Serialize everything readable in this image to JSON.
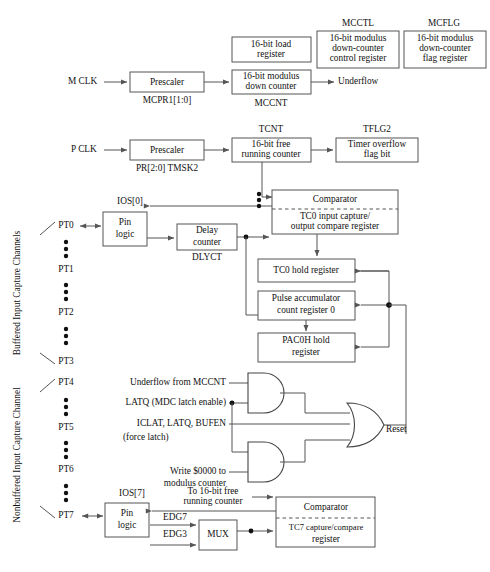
{
  "diagram": {
    "colors": {
      "line": "#555555",
      "box_fill": "#ffffff",
      "text": "#111111"
    },
    "inputs": {
      "m_clk": "M CLK",
      "p_clk": "P CLK"
    },
    "modulus_section": {
      "prescaler": "Prescaler",
      "prescaler_sub": "MCPR1[1:0]",
      "load_register": "16-bit load\nregister",
      "load_register_line1": "16-bit load",
      "load_register_line2": "register",
      "down_counter_line1": "16-bit modulus",
      "down_counter_line2": "down counter",
      "down_counter_sub": "MCCNT",
      "underflow": "Underflow",
      "mcctl_title": "MCCTL",
      "mcctl_line1": "16-bit modulus",
      "mcctl_line2": "down-counter",
      "mcctl_line3": "control register",
      "mcflg_title": "MCFLG",
      "mcflg_line1": "16-bit modulus",
      "mcflg_line2": "down-counter",
      "mcflg_line3": "flag register"
    },
    "free_running_section": {
      "prescaler": "Prescaler",
      "prescaler_sub": "PR[2:0] TMSK2",
      "tcnt_title": "TCNT",
      "tcnt_line1": "16-bit free",
      "tcnt_line2": "running counter",
      "tflg2_title": "TFLG2",
      "tflg2_line1": "Timer overflow",
      "tflg2_line2": "flag bit"
    },
    "channel0": {
      "ios_label": "IOS[0]",
      "pin_logic_line1": "Pin",
      "pin_logic_line2": "logic",
      "delay_line1": "Delay",
      "delay_line2": "counter",
      "delay_sub": "DLYCT",
      "comparator": "Comparator",
      "tc0_reg_line1": "TC0 input capture/",
      "tc0_reg_line2": "output compare register",
      "tc0_hold": "TC0 hold register",
      "pac_line1": "Pulse accumulator",
      "pac_line2": "count register 0",
      "pac0h_line1": "PAC0H hold",
      "pac0h_line2": "register"
    },
    "logic_gates": {
      "and1_in1": "Underflow from MCCNT",
      "and1_in2": "LATQ (MDC latch enable)",
      "or_in_mid_line1": "ICLAT, LATQ, BUFEN",
      "or_in_mid_line2": "(force latch)",
      "and2_in_line1": "Write $0000 to",
      "and2_in_line2": "modulus counter",
      "or_out": "Reset"
    },
    "channel7": {
      "ios_label": "IOS[7]",
      "pin_logic_line1": "Pin",
      "pin_logic_line2": "logic",
      "to_counter_line1": "To 16-bit free",
      "to_counter_line2": "running counter",
      "edg7": "EDG7",
      "edg3": "EDG3",
      "mux": "MUX",
      "comparator": "Comparator",
      "tc7_line1": "TC7 capture/compare",
      "tc7_line2": "register"
    },
    "side_labels": {
      "buffered": "Buffered Input Capture Channels",
      "nonbuffered": "Nonbuffered Input Capture Channel"
    },
    "pins": [
      {
        "name": "PT0",
        "y": 226
      },
      {
        "name": "PT1",
        "y": 270
      },
      {
        "name": "PT2",
        "y": 313
      },
      {
        "name": "PT3",
        "y": 362
      },
      {
        "name": "PT4",
        "y": 383
      },
      {
        "name": "PT5",
        "y": 428
      },
      {
        "name": "PT6",
        "y": 470
      },
      {
        "name": "PT7",
        "y": 516
      }
    ]
  }
}
